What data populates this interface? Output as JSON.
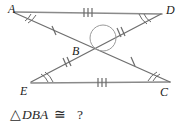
{
  "figure": {
    "kind": "geometry-diagram",
    "vertices": [
      {
        "name": "A",
        "label": "A",
        "x": 14,
        "y": 8,
        "label_x": 8,
        "label_y": 13
      },
      {
        "name": "D",
        "label": "D",
        "x": 162,
        "y": 10,
        "label_x": 166,
        "label_y": 14
      },
      {
        "name": "B",
        "label": "B",
        "x": 94,
        "y": 50,
        "label_x": 72,
        "label_y": 55
      },
      {
        "name": "E",
        "label": "E",
        "x": 31,
        "y": 86,
        "label_x": 20,
        "label_y": 93
      },
      {
        "name": "C",
        "label": "C",
        "x": 170,
        "y": 84,
        "label_x": 160,
        "label_y": 94
      }
    ],
    "segments": [
      {
        "name": "AD",
        "from": "A",
        "to": "D",
        "ticks": 3,
        "tick_position": 0.5
      },
      {
        "name": "EC",
        "from": "E",
        "to": "C",
        "ticks": 3,
        "tick_position": 0.5
      },
      {
        "name": "AB",
        "from": "A",
        "to": "B",
        "ticks": 1,
        "tick_position": 0.5
      },
      {
        "name": "BC",
        "from": "B",
        "to": "C",
        "ticks": 1,
        "tick_position": 0.5
      },
      {
        "name": "DB",
        "from": "D",
        "to": "B",
        "ticks": 2,
        "tick_position": 0.5
      },
      {
        "name": "BE",
        "from": "B",
        "to": "E",
        "ticks": 2,
        "tick_position": 0.5
      }
    ],
    "angle_marks": [
      {
        "name": "angle-A",
        "vertex": "A",
        "arcs": 2
      },
      {
        "name": "angle-D",
        "vertex": "D",
        "arcs": 2
      },
      {
        "name": "angle-E",
        "vertex": "E",
        "arcs": 2
      },
      {
        "name": "angle-C",
        "vertex": "C",
        "arcs": 2
      }
    ],
    "vertical_angle_mark": {
      "name": "vertical-angle-arc-at-B",
      "cx": 101,
      "cy": 46,
      "r": 13
    }
  },
  "question": {
    "triangle_symbol": "△",
    "triangle_name": "DBA",
    "congruent_symbol": "≅",
    "answer_placeholder": "?",
    "full_text": "△DBA ≅ ?"
  },
  "colors": {
    "line": "#8a8a8a",
    "diagonal": "#6f6f6f",
    "mark": "#6a6a6a",
    "text": "#1a1a1a",
    "question_text": "#2b2b2b",
    "background": "#ffffff"
  }
}
